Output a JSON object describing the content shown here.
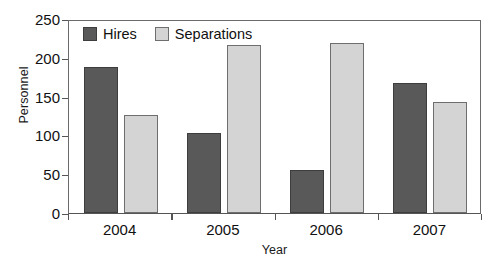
{
  "chart_data": {
    "type": "bar",
    "title": "",
    "xlabel": "Year",
    "ylabel": "Personnel",
    "categories": [
      "2004",
      "2005",
      "2006",
      "2007"
    ],
    "series": [
      {
        "name": "Hires",
        "color": "#595959",
        "values": [
          188,
          103,
          55,
          167
        ]
      },
      {
        "name": "Separations",
        "color": "#d4d4d4",
        "values": [
          126,
          217,
          219,
          143
        ]
      }
    ],
    "ylim": [
      0,
      250
    ],
    "yticks": [
      0,
      50,
      100,
      150,
      200,
      250
    ],
    "grid": false,
    "legend_position": "top-left-inside"
  }
}
